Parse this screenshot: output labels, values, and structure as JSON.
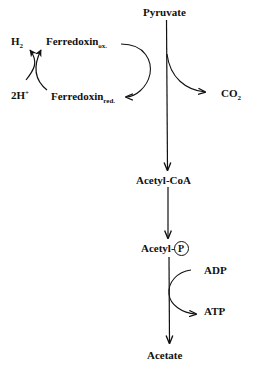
{
  "diagram": {
    "type": "metabolic-pathway",
    "main_pathway": {
      "nodes": [
        {
          "id": "pyruvate",
          "label": "Pyruvate"
        },
        {
          "id": "acetyl_coa",
          "label": "Acetyl-CoA"
        },
        {
          "id": "acetyl_p",
          "label": "Acetyl-",
          "phosphate_symbol": "P"
        },
        {
          "id": "acetate",
          "label": "Acetate"
        }
      ],
      "edges": [
        {
          "from": "pyruvate",
          "to": "acetyl_coa",
          "side_product": "co2"
        },
        {
          "from": "acetyl_coa",
          "to": "acetyl_p"
        },
        {
          "from": "acetyl_p",
          "to": "acetate",
          "cofactor_in": "adp",
          "cofactor_out": "atp"
        }
      ]
    },
    "side_labels": {
      "co2": {
        "base": "CO",
        "sub": "2"
      },
      "adp": "ADP",
      "atp": "ATP"
    },
    "ferredoxin_cycle": {
      "h2": {
        "base": "H",
        "sub": "2"
      },
      "two_h_plus": {
        "base": "2H",
        "sup": "+"
      },
      "ferredoxin_ox": {
        "base": "Ferredoxin",
        "sub": "ox."
      },
      "ferredoxin_red": {
        "base": "Ferredoxin",
        "sub": "red."
      }
    },
    "colors": {
      "line": "#111111",
      "background": "#ffffff"
    }
  }
}
